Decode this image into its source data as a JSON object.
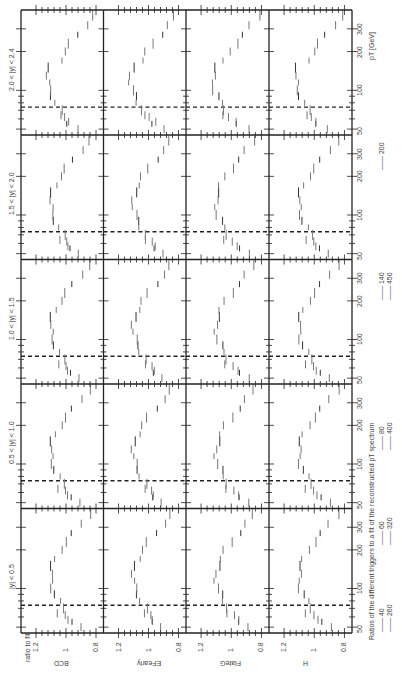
{
  "chart_data": {
    "type": "scatter",
    "orientation": "figure rotated 90 degrees counter-clockwise",
    "xlabel": "p_T [GeV]",
    "ylabel": "ratio to fit",
    "x_scale": "log",
    "x_ticks": [
      50,
      100,
      200,
      300
    ],
    "y_ticks": [
      0.8,
      1.0,
      1.2
    ],
    "ylim": [
      0.75,
      1.3
    ],
    "grid": false,
    "panel_rows": [
      "|y| < 0.5",
      "0.5 < |y| < 1.0",
      "1.0 < |y| < 1.5",
      "1.5 < |y| < 2.0",
      "2.0 < |y| < 2.4"
    ],
    "panel_columns": [
      "BCD",
      "EFearly",
      "FlateG",
      "H"
    ],
    "threshold_marker": {
      "style": "dashed",
      "pT": 74
    },
    "legend": {
      "title": "Ratios of the different triggers to a fit of the reconstructed p_T spectrum",
      "entries": [
        "40",
        "60",
        "80",
        "140",
        "200",
        "260",
        "320",
        "400",
        "450"
      ]
    },
    "series_shape": {
      "description": "Ratio rises from ~0.95 at low pT to ~1.1 at intermediate pT then falls to ~0.85 at high pT",
      "pT": [
        55,
        62,
        70,
        80,
        90,
        100,
        115,
        130,
        150,
        170,
        200,
        230,
        270,
        320,
        380
      ],
      "ratio": [
        0.96,
        0.99,
        1.02,
        1.05,
        1.07,
        1.09,
        1.1,
        1.1,
        1.09,
        1.07,
        1.04,
        1.0,
        0.95,
        0.9,
        0.85
      ]
    }
  },
  "labels": {
    "ylabel": "ratio to fit",
    "xlabel_p": "p",
    "xlabel_sub": "T",
    "xlabel_unit": "[GeV]",
    "rows": [
      "|y| < 0.5",
      "0.5 < |y| < 1.0",
      "1.0 < |y| < 1.5",
      "1.5 < |y| < 2.0",
      "2.0 < |y| < 2.4"
    ],
    "columns": [
      "BCD",
      "EFearly",
      "FlateG",
      "H"
    ],
    "yticks": [
      "1.2",
      "1",
      "0.8"
    ],
    "xticks": [
      "50",
      "100",
      "200",
      "300"
    ],
    "legend_title": "Ratios of the different triggers to a fit of the reconstructed p",
    "legend_title_sub": "T",
    "legend_title_end": " spectrum",
    "legend_row1": [
      "40",
      "60",
      "80",
      "140",
      "200"
    ],
    "legend_row2": [
      "260",
      "320",
      "400",
      "450"
    ]
  },
  "colors": {
    "axis": "#222222",
    "dashed": "#222222",
    "points": "#777777",
    "points_dark": "#333333"
  }
}
